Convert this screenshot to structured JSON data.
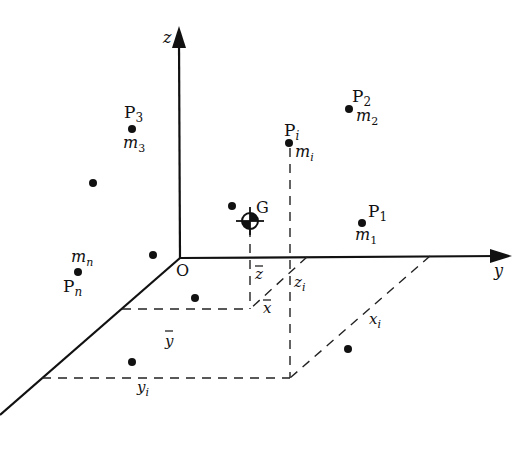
{
  "diagram": {
    "type": "3d-coordinate-system",
    "axes": {
      "x": "x",
      "y": "y",
      "z": "z",
      "origin": "O"
    },
    "points": [
      {
        "name": "P",
        "sub": "1",
        "mass": "m",
        "mass_sub": "1"
      },
      {
        "name": "P",
        "sub": "2",
        "mass": "m",
        "mass_sub": "2"
      },
      {
        "name": "P",
        "sub": "3",
        "mass": "m",
        "mass_sub": "3"
      },
      {
        "name": "P",
        "sub": "i",
        "mass": "m",
        "mass_sub": "i"
      },
      {
        "name": "P",
        "sub": "n",
        "mass": "m",
        "mass_sub": "n"
      }
    ],
    "center_of_mass": "G",
    "coordinates": {
      "x_bar": "x",
      "y_bar": "y",
      "z_bar": "z",
      "x_i": "x",
      "x_i_sub": "i",
      "y_i": "y",
      "y_i_sub": "i",
      "z_i": "z",
      "z_i_sub": "i"
    }
  }
}
